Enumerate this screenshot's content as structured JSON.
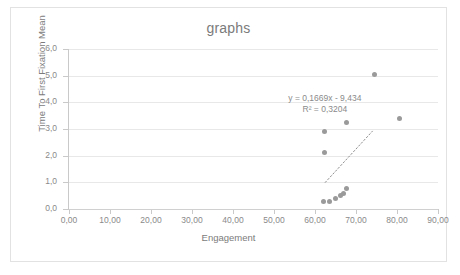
{
  "chart_data": {
    "type": "scatter",
    "title": "graphs",
    "xlabel": "Engagement",
    "ylabel": "Time To First Fixation Mean",
    "xlim": [
      0,
      90
    ],
    "ylim": [
      0,
      6
    ],
    "xticks": [
      "0,00",
      "10,00",
      "20,00",
      "30,00",
      "40,00",
      "50,00",
      "60,00",
      "70,00",
      "80,00",
      "90,00"
    ],
    "xtick_values": [
      0,
      10,
      20,
      30,
      40,
      50,
      60,
      70,
      80,
      90
    ],
    "yticks": [
      "0,0",
      "1,0",
      "2,0",
      "3,0",
      "4,0",
      "5,0",
      "6,0"
    ],
    "ytick_values": [
      0,
      1,
      2,
      3,
      4,
      5,
      6
    ],
    "grid": "horizontal",
    "legend": "none",
    "series": [
      {
        "name": "Time To First Fixation Mean",
        "marker_color": "#9a9a9a",
        "points": [
          {
            "x": 62.0,
            "y": 0.3
          },
          {
            "x": 63.6,
            "y": 0.3
          },
          {
            "x": 65.0,
            "y": 0.4
          },
          {
            "x": 66.1,
            "y": 0.5
          },
          {
            "x": 67.0,
            "y": 0.58
          },
          {
            "x": 67.8,
            "y": 0.76
          },
          {
            "x": 62.3,
            "y": 2.12
          },
          {
            "x": 62.3,
            "y": 2.9
          },
          {
            "x": 67.6,
            "y": 3.25
          },
          {
            "x": 74.5,
            "y": 5.06
          },
          {
            "x": 80.6,
            "y": 3.4
          }
        ]
      }
    ],
    "trendline": {
      "style": "dotted",
      "color": "#8f8f8f",
      "slope": 0.1669,
      "intercept": -9.434,
      "x_start": 62.5,
      "x_end": 74.0,
      "equation": "y = 0,1669x - 9,434",
      "r_squared_label": "R² = 0,3204",
      "r_squared": 0.3204
    }
  },
  "colors": {
    "frame_border": "#e2e2e2",
    "gridline": "#e8e8e8",
    "axis_line": "#c9c9c9",
    "text": "#8a8a8a",
    "marker": "#9a9a9a"
  }
}
